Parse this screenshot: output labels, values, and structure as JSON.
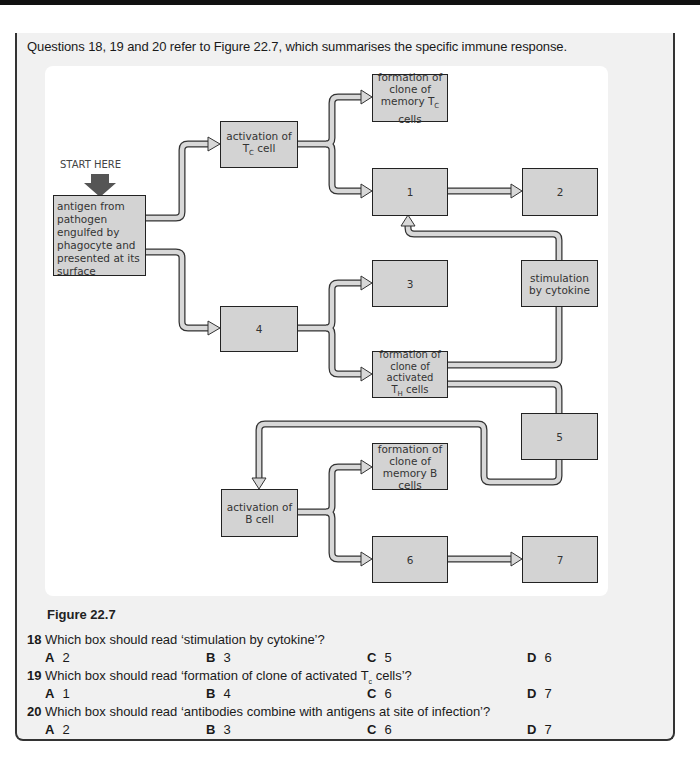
{
  "intro": "Questions 18, 19 and 20 refer to Figure 22.7, which summarises the specific immune response.",
  "diagram": {
    "start_label": "START HERE",
    "boxes": {
      "antigen": "antigen from pathogen engulfed by phagocyte and presented at its surface",
      "activation_tc_line1": "activation of",
      "activation_tc_line2_main": "T",
      "activation_tc_line2_sub": "C",
      "activation_tc_line2_rest": " cell",
      "memory_tc_line1": "formation of",
      "memory_tc_line2": "clone of",
      "memory_tc_line3_main": "memory T",
      "memory_tc_line3_sub": "C",
      "memory_tc_line3_rest": " cells",
      "box1": "1",
      "box2": "2",
      "box3": "3",
      "cytokine": "stimulation by cytokine",
      "box4": "4",
      "th_line1": "formation of",
      "th_line2": "clone of activated",
      "th_line3_main": "T",
      "th_line3_sub": "H",
      "th_line3_rest": " cells",
      "box5": "5",
      "memory_b": "formation of clone of memory B cells",
      "activation_b": "activation of B cell",
      "box6": "6",
      "box7": "7"
    },
    "colors": {
      "box_fill": "#d3d3d3",
      "box_border": "#222222",
      "connector_fill": "#d8d8d8",
      "start_arrow": "#555555"
    }
  },
  "figure_caption": "Figure 22.7",
  "questions": [
    {
      "number": "18",
      "text": "Which box should read ‘stimulation by cytokine’?",
      "options": [
        {
          "letter": "A",
          "value": "2"
        },
        {
          "letter": "B",
          "value": "3"
        },
        {
          "letter": "C",
          "value": "5"
        },
        {
          "letter": "D",
          "value": "6"
        }
      ]
    },
    {
      "number": "19",
      "text_before": "Which box should read ‘formation of clone of activated T",
      "text_sub": "c",
      "text_after": " cells’?",
      "options": [
        {
          "letter": "A",
          "value": "1"
        },
        {
          "letter": "B",
          "value": "4"
        },
        {
          "letter": "C",
          "value": "6"
        },
        {
          "letter": "D",
          "value": "7"
        }
      ]
    },
    {
      "number": "20",
      "text": "Which box should read ‘antibodies combine with antigens at site of infection’?",
      "options": [
        {
          "letter": "A",
          "value": "2"
        },
        {
          "letter": "B",
          "value": "3"
        },
        {
          "letter": "C",
          "value": "6"
        },
        {
          "letter": "D",
          "value": "7"
        }
      ]
    }
  ]
}
